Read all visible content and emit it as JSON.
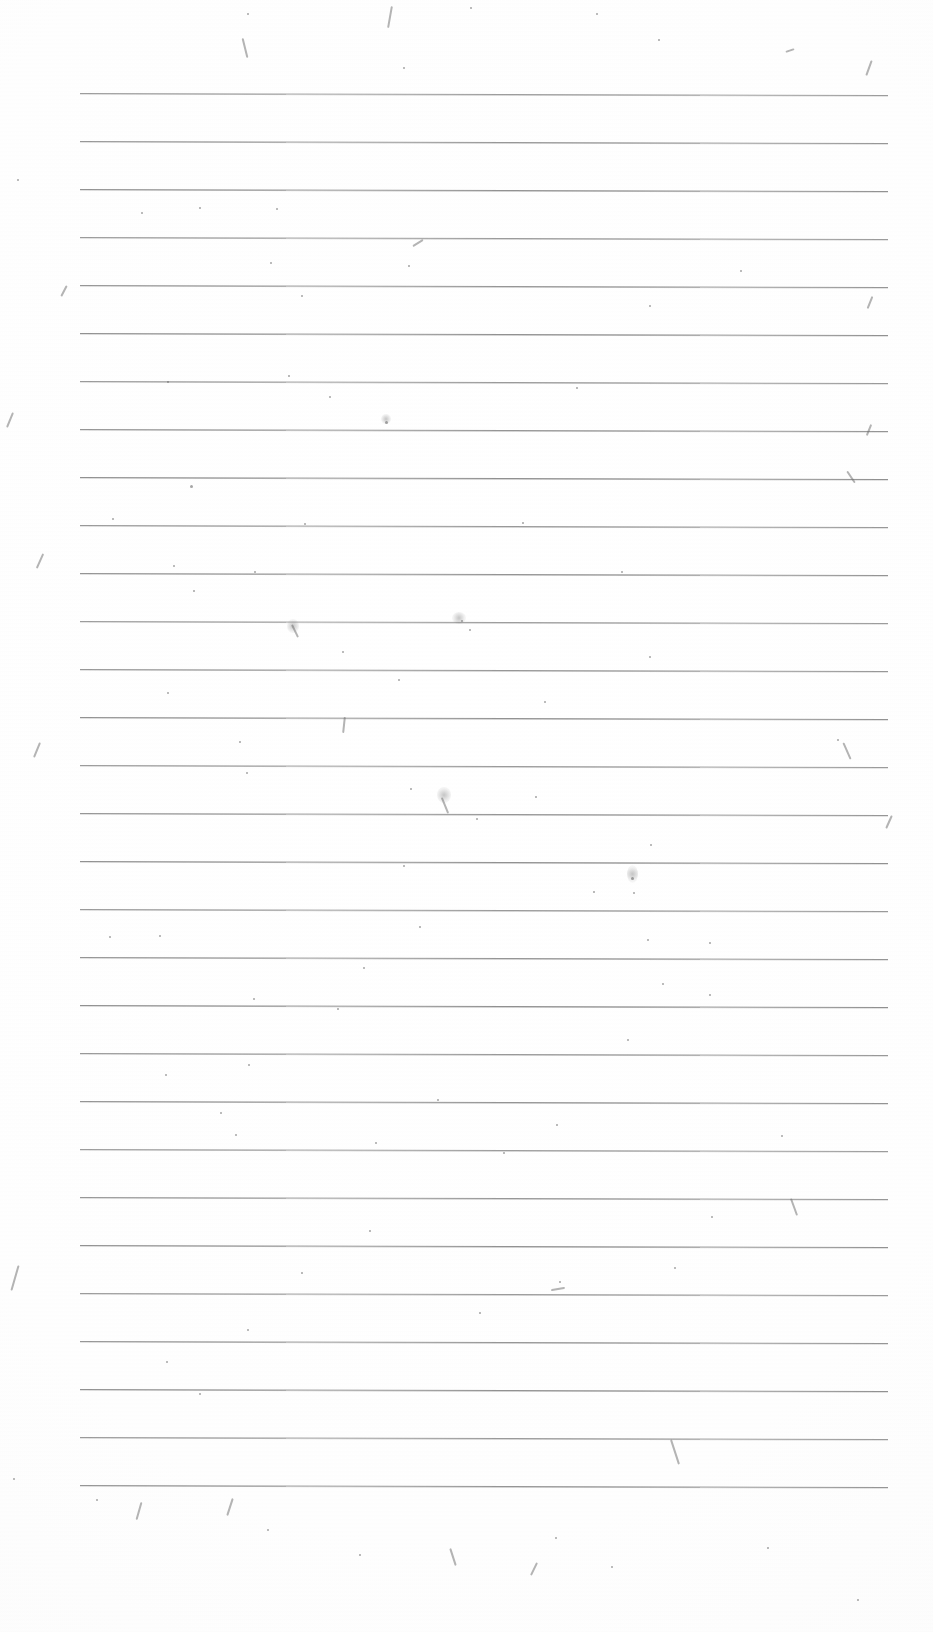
{
  "document": {
    "kind": "scanned-ruled-paper",
    "title": "Blank Ruled Notebook Page",
    "caption": "Scanned blank sheet of wide-ruled lined paper with no handwriting or printed text; only horizontal ruling lines and scanner dust specks are visible.",
    "page_width": 933,
    "page_height": 1632,
    "background_color": "#ffffff",
    "paper_tone_color": "#fdfdfd"
  },
  "ruling": {
    "line_color": "#8d8d8d",
    "line_thickness_px": 1,
    "line_count": 30,
    "left_x": 80,
    "right_x": 888,
    "line_length_px": 808,
    "first_line_y": 93,
    "line_spacing_px": 48,
    "last_line_y": 1485,
    "skew_degrees": 0.14,
    "top_margin_px": 93,
    "bottom_margin_px": 147,
    "left_margin_px": 80,
    "right_margin_px": 45,
    "lines_y": [
      93,
      141,
      189,
      237,
      285,
      333,
      381,
      429,
      477,
      525,
      573,
      621,
      669,
      717,
      765,
      813,
      861,
      909,
      957,
      1005,
      1053,
      1101,
      1149,
      1197,
      1245,
      1293,
      1341,
      1389,
      1437,
      1485
    ]
  },
  "artifacts": {
    "description": "scanner dust, fiber streaks and toner specks",
    "speck_color": "#5d5d5d",
    "streak_color": "#6a6a6a",
    "specks": [
      {
        "x": 248,
        "y": 14,
        "r": 1.2
      },
      {
        "x": 471,
        "y": 8,
        "r": 1.0
      },
      {
        "x": 597,
        "y": 14,
        "r": 1.1
      },
      {
        "x": 659,
        "y": 40,
        "r": 0.9
      },
      {
        "x": 404,
        "y": 68,
        "r": 1.0
      },
      {
        "x": 18,
        "y": 180,
        "r": 1.3
      },
      {
        "x": 142,
        "y": 213,
        "r": 1.1
      },
      {
        "x": 200,
        "y": 208,
        "r": 0.9
      },
      {
        "x": 277,
        "y": 209,
        "r": 1.0
      },
      {
        "x": 271,
        "y": 263,
        "r": 1.1
      },
      {
        "x": 409,
        "y": 266,
        "r": 0.9
      },
      {
        "x": 741,
        "y": 271,
        "r": 1.2
      },
      {
        "x": 302,
        "y": 296,
        "r": 1.0
      },
      {
        "x": 650,
        "y": 306,
        "r": 1.1
      },
      {
        "x": 168,
        "y": 382,
        "r": 1.4
      },
      {
        "x": 289,
        "y": 376,
        "r": 0.9
      },
      {
        "x": 330,
        "y": 397,
        "r": 1.0
      },
      {
        "x": 577,
        "y": 388,
        "r": 0.9
      },
      {
        "x": 386,
        "y": 422,
        "r": 1.5
      },
      {
        "x": 191,
        "y": 486,
        "r": 1.5
      },
      {
        "x": 113,
        "y": 519,
        "r": 1.0
      },
      {
        "x": 305,
        "y": 524,
        "r": 1.0
      },
      {
        "x": 523,
        "y": 523,
        "r": 0.9
      },
      {
        "x": 174,
        "y": 566,
        "r": 1.1
      },
      {
        "x": 255,
        "y": 572,
        "r": 1.0
      },
      {
        "x": 194,
        "y": 591,
        "r": 0.9
      },
      {
        "x": 622,
        "y": 572,
        "r": 1.0
      },
      {
        "x": 343,
        "y": 652,
        "r": 1.0
      },
      {
        "x": 650,
        "y": 657,
        "r": 1.1
      },
      {
        "x": 462,
        "y": 621,
        "r": 1.3
      },
      {
        "x": 470,
        "y": 630,
        "r": 1.0
      },
      {
        "x": 168,
        "y": 693,
        "r": 1.2
      },
      {
        "x": 399,
        "y": 680,
        "r": 1.0
      },
      {
        "x": 545,
        "y": 702,
        "r": 1.1
      },
      {
        "x": 240,
        "y": 742,
        "r": 0.9
      },
      {
        "x": 838,
        "y": 740,
        "r": 1.0
      },
      {
        "x": 247,
        "y": 773,
        "r": 1.3
      },
      {
        "x": 411,
        "y": 789,
        "r": 0.9
      },
      {
        "x": 477,
        "y": 819,
        "r": 1.0
      },
      {
        "x": 536,
        "y": 797,
        "r": 0.9
      },
      {
        "x": 651,
        "y": 845,
        "r": 1.0
      },
      {
        "x": 404,
        "y": 866,
        "r": 1.0
      },
      {
        "x": 594,
        "y": 892,
        "r": 0.9
      },
      {
        "x": 632,
        "y": 878,
        "r": 1.5
      },
      {
        "x": 634,
        "y": 893,
        "r": 1.2
      },
      {
        "x": 110,
        "y": 937,
        "r": 1.1
      },
      {
        "x": 160,
        "y": 936,
        "r": 1.0
      },
      {
        "x": 420,
        "y": 927,
        "r": 0.9
      },
      {
        "x": 648,
        "y": 940,
        "r": 1.0
      },
      {
        "x": 710,
        "y": 943,
        "r": 0.9
      },
      {
        "x": 364,
        "y": 968,
        "r": 1.0
      },
      {
        "x": 663,
        "y": 984,
        "r": 1.2
      },
      {
        "x": 254,
        "y": 999,
        "r": 1.0
      },
      {
        "x": 710,
        "y": 995,
        "r": 0.9
      },
      {
        "x": 338,
        "y": 1009,
        "r": 0.9
      },
      {
        "x": 628,
        "y": 1040,
        "r": 1.0
      },
      {
        "x": 166,
        "y": 1075,
        "r": 1.2
      },
      {
        "x": 249,
        "y": 1065,
        "r": 1.1
      },
      {
        "x": 438,
        "y": 1100,
        "r": 1.2
      },
      {
        "x": 221,
        "y": 1113,
        "r": 1.0
      },
      {
        "x": 782,
        "y": 1136,
        "r": 1.1
      },
      {
        "x": 236,
        "y": 1135,
        "r": 1.0
      },
      {
        "x": 376,
        "y": 1143,
        "r": 1.4
      },
      {
        "x": 504,
        "y": 1153,
        "r": 1.0
      },
      {
        "x": 557,
        "y": 1125,
        "r": 0.9
      },
      {
        "x": 712,
        "y": 1217,
        "r": 1.2
      },
      {
        "x": 370,
        "y": 1231,
        "r": 0.9
      },
      {
        "x": 675,
        "y": 1268,
        "r": 1.0
      },
      {
        "x": 302,
        "y": 1273,
        "r": 0.9
      },
      {
        "x": 560,
        "y": 1282,
        "r": 1.0
      },
      {
        "x": 248,
        "y": 1330,
        "r": 1.0
      },
      {
        "x": 480,
        "y": 1313,
        "r": 0.9
      },
      {
        "x": 167,
        "y": 1362,
        "r": 1.1
      },
      {
        "x": 200,
        "y": 1394,
        "r": 1.0
      },
      {
        "x": 14,
        "y": 1479,
        "r": 1.2
      },
      {
        "x": 97,
        "y": 1500,
        "r": 1.1
      },
      {
        "x": 268,
        "y": 1530,
        "r": 1.0
      },
      {
        "x": 360,
        "y": 1555,
        "r": 0.9
      },
      {
        "x": 556,
        "y": 1538,
        "r": 1.0
      },
      {
        "x": 768,
        "y": 1548,
        "r": 0.9
      },
      {
        "x": 612,
        "y": 1567,
        "r": 1.0
      },
      {
        "x": 858,
        "y": 1600,
        "r": 0.9
      }
    ],
    "streaks": [
      {
        "x": 389,
        "y": 6,
        "w": 2,
        "h": 22,
        "rot": 10
      },
      {
        "x": 244,
        "y": 38,
        "w": 2,
        "h": 20,
        "rot": -14
      },
      {
        "x": 789,
        "y": 46,
        "w": 2,
        "h": 9,
        "rot": 72
      },
      {
        "x": 868,
        "y": 60,
        "w": 2,
        "h": 16,
        "rot": 20
      },
      {
        "x": 63,
        "y": 285,
        "w": 2,
        "h": 12,
        "rot": 28
      },
      {
        "x": 869,
        "y": 296,
        "w": 2,
        "h": 13,
        "rot": 22
      },
      {
        "x": 417,
        "y": 237,
        "w": 2,
        "h": 12,
        "rot": 58
      },
      {
        "x": 9,
        "y": 412,
        "w": 2,
        "h": 16,
        "rot": 22
      },
      {
        "x": 868,
        "y": 424,
        "w": 2,
        "h": 12,
        "rot": 22
      },
      {
        "x": 963,
        "y": 455,
        "w": 2,
        "h": 12,
        "rot": 22
      },
      {
        "x": 850,
        "y": 470,
        "w": 2,
        "h": 14,
        "rot": -34
      },
      {
        "x": 39,
        "y": 553,
        "w": 2,
        "h": 16,
        "rot": 24
      },
      {
        "x": 294,
        "y": 624,
        "w": 2,
        "h": 14,
        "rot": -26
      },
      {
        "x": 343,
        "y": 717,
        "w": 2,
        "h": 16,
        "rot": 6
      },
      {
        "x": 36,
        "y": 742,
        "w": 2,
        "h": 16,
        "rot": 22
      },
      {
        "x": 846,
        "y": 742,
        "w": 2,
        "h": 18,
        "rot": -24
      },
      {
        "x": 444,
        "y": 797,
        "w": 2,
        "h": 17,
        "rot": -22
      },
      {
        "x": 888,
        "y": 815,
        "w": 2,
        "h": 14,
        "rot": 24
      },
      {
        "x": 793,
        "y": 1198,
        "w": 2,
        "h": 18,
        "rot": -20
      },
      {
        "x": 14,
        "y": 1265,
        "w": 2,
        "h": 26,
        "rot": 16
      },
      {
        "x": 557,
        "y": 1282,
        "w": 2,
        "h": 14,
        "rot": 80
      },
      {
        "x": 674,
        "y": 1439,
        "w": 2,
        "h": 26,
        "rot": -18
      },
      {
        "x": 138,
        "y": 1502,
        "w": 2,
        "h": 18,
        "rot": 16
      },
      {
        "x": 229,
        "y": 1498,
        "w": 2,
        "h": 18,
        "rot": 18
      },
      {
        "x": 452,
        "y": 1548,
        "w": 2,
        "h": 18,
        "rot": -18
      },
      {
        "x": 533,
        "y": 1562,
        "w": 2,
        "h": 14,
        "rot": 26
      }
    ],
    "smudges": [
      {
        "x": 293,
        "y": 626,
        "w": 12,
        "h": 14
      },
      {
        "x": 459,
        "y": 618,
        "w": 14,
        "h": 12
      },
      {
        "x": 632,
        "y": 874,
        "w": 11,
        "h": 18
      },
      {
        "x": 444,
        "y": 795,
        "w": 14,
        "h": 16
      },
      {
        "x": 386,
        "y": 419,
        "w": 10,
        "h": 10
      }
    ]
  }
}
